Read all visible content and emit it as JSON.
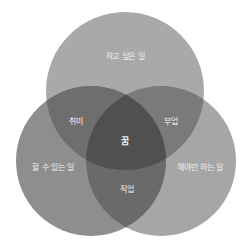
{
  "diagram": {
    "type": "venn",
    "circles": [
      {
        "id": "top",
        "label": "하고 싶은 일",
        "cx": 125,
        "cy": 91,
        "r": 79,
        "color": "#a9a9a9"
      },
      {
        "id": "left",
        "label": "할 수 있는 일",
        "cx": 91,
        "cy": 161,
        "r": 75,
        "color": "#8e8e8e"
      },
      {
        "id": "right",
        "label": "해야만 하는 일",
        "cx": 161,
        "cy": 161,
        "r": 75,
        "color": "#a6a6a6"
      }
    ],
    "intersections": {
      "top_left": {
        "label": "취미",
        "color": "#6e6e6e"
      },
      "top_right": {
        "label": "부업",
        "color": "#7a7a7a"
      },
      "left_right": {
        "label": "직업",
        "color": "#6a6a6a"
      },
      "all": {
        "label": "꿈",
        "color": "#505050"
      }
    },
    "background": "#ffffff",
    "text_color": "#f2f2f2"
  }
}
